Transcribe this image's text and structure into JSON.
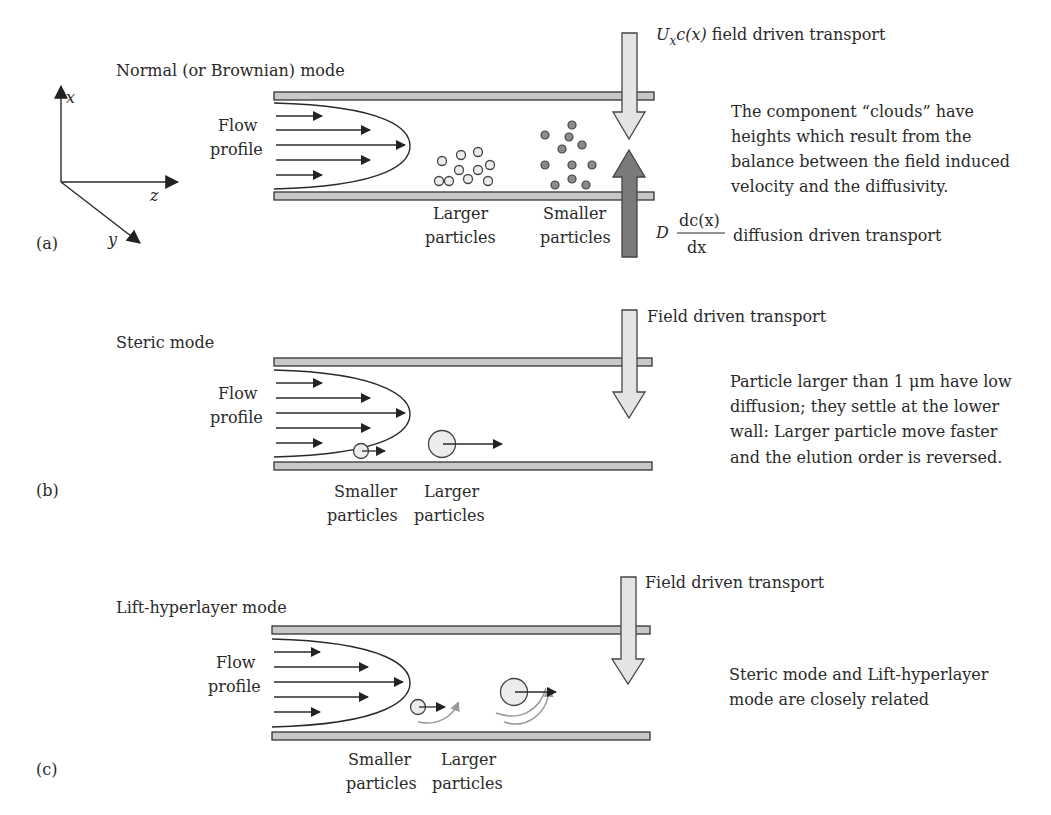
{
  "axes": {
    "x_label": "x",
    "y_label": "y",
    "z_label": "z"
  },
  "panels": [
    {
      "id": "a",
      "label": "(a)",
      "title": "Normal (or Brownian) mode",
      "flow_label_line1": "Flow",
      "flow_label_line2": "profile",
      "particle_labels": [
        {
          "line1": "Larger",
          "line2": "particles"
        },
        {
          "line1": "Smaller",
          "line2": "particles"
        }
      ],
      "field_transport": {
        "math_U": "U",
        "math_sub": "x",
        "math_rest": "c(x)",
        "text": " field driven transport"
      },
      "diffusion_transport": {
        "math_D": "D",
        "numerator": "dc(x)",
        "denominator": "dx",
        "text": "diffusion driven transport"
      },
      "description_lines": [
        "The component “clouds” have",
        "heights which result from the",
        "balance between the field induced",
        "velocity and the diffusivity."
      ]
    },
    {
      "id": "b",
      "label": "(b)",
      "title": "Steric mode",
      "flow_label_line1": "Flow",
      "flow_label_line2": "profile",
      "particle_labels": [
        {
          "line1": "Smaller",
          "line2": "particles"
        },
        {
          "line1": "Larger",
          "line2": "particles"
        }
      ],
      "field_transport_text": "Field driven transport",
      "description_lines": [
        "Particle larger than 1 μm have low",
        "diffusion; they settle at the lower",
        "wall: Larger particle move faster",
        "and the elution order is reversed."
      ]
    },
    {
      "id": "c",
      "label": "(c)",
      "title": "Lift-hyperlayer mode",
      "flow_label_line1": "Flow",
      "flow_label_line2": "profile",
      "particle_labels": [
        {
          "line1": "Smaller",
          "line2": "particles"
        },
        {
          "line1": "Larger",
          "line2": "particles"
        }
      ],
      "field_transport_text": "Field driven transport",
      "description_lines": [
        "Steric mode and Lift-hyperlayer",
        "mode are closely related"
      ]
    }
  ],
  "colors": {
    "wall_fill": "#c8c8c8",
    "field_arrow_fill": "#e4e4e4",
    "diffusion_arrow_fill": "#7a7a7a",
    "larger_particle_fill": "#ececec",
    "smaller_particle_fill": "#8a8a8a",
    "lift_arrow": "#9a9a9a"
  }
}
